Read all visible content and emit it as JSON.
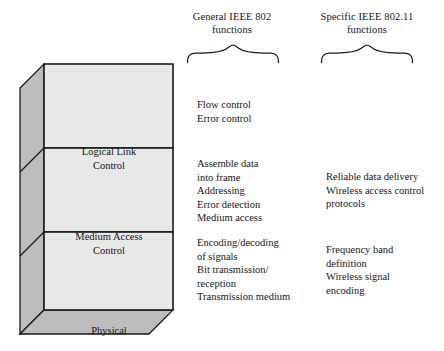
{
  "figure": {
    "colors": {
      "front_face": "#e8e8e8",
      "side_face": "#bdbdbd",
      "bottom_face": "#bdbdbd",
      "outline": "#1a1a1a",
      "text": "#15151a",
      "background": "#ffffff"
    }
  },
  "headings": {
    "general": {
      "line1": "General IEEE 802",
      "line2": "functions",
      "brace_icon": "curly-brace-down-icon"
    },
    "specific": {
      "line1": "Specific IEEE 802.11",
      "line2": "functions",
      "brace_icon": "curly-brace-down-icon"
    }
  },
  "layers": [
    {
      "id": "logical-link-control",
      "label_line1": "Logical Link",
      "label_line2": "Control"
    },
    {
      "id": "medium-access-control",
      "label_line1": "Medium Access",
      "label_line2": "Control"
    },
    {
      "id": "physical",
      "label_line1": "Physical",
      "label_line2": ""
    }
  ],
  "functions": {
    "llc_general": [
      "Flow control",
      "Error control"
    ],
    "mac_general": [
      "Assemble data",
      "into frame",
      "Addressing",
      "Error detection",
      "Medium access"
    ],
    "phy_general": [
      "Encoding/decoding",
      "of signals",
      "Bit transmission/",
      "reception",
      "Transmission medium"
    ],
    "mac_specific": [
      "Reliable data delivery",
      "Wireless access control",
      "protocols"
    ],
    "phy_specific": [
      "Frequency band",
      "definition",
      "Wireless signal",
      "encoding"
    ]
  }
}
